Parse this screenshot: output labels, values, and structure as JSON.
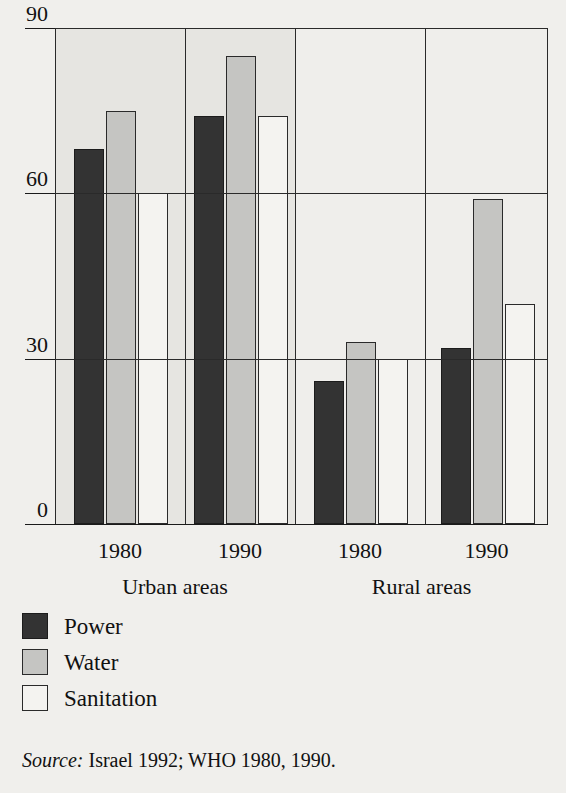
{
  "chart_data": {
    "type": "bar",
    "title": "",
    "xlabel": "",
    "ylabel": "",
    "ylim": [
      0,
      90
    ],
    "yticks": [
      0,
      30,
      60,
      90
    ],
    "ytick_labels": [
      "0",
      "30",
      "60",
      "90"
    ],
    "grid": true,
    "legend_position": "below-left",
    "categories": [
      "1980",
      "1990",
      "1980",
      "1990"
    ],
    "groups": [
      {
        "label": "Urban areas",
        "categories": [
          "1980",
          "1990"
        ]
      },
      {
        "label": "Rural areas",
        "categories": [
          "1980",
          "1990"
        ]
      }
    ],
    "series": [
      {
        "name": "Power",
        "color": "#333333",
        "values": [
          68,
          74,
          26,
          32
        ]
      },
      {
        "name": "Water",
        "color": "#c5c5c2",
        "values": [
          75,
          85,
          33,
          59
        ]
      },
      {
        "name": "Sanitation",
        "color": "#f4f3f0",
        "values": [
          60,
          74,
          30,
          40
        ]
      }
    ],
    "panels": [
      {
        "group": "Urban areas",
        "category": "1980",
        "shaded": true,
        "bars": [
          {
            "series": "Power",
            "value": 68
          },
          {
            "series": "Water",
            "value": 75
          },
          {
            "series": "Sanitation",
            "value": 60
          }
        ]
      },
      {
        "group": "Urban areas",
        "category": "1990",
        "shaded": true,
        "bars": [
          {
            "series": "Power",
            "value": 74
          },
          {
            "series": "Water",
            "value": 85
          },
          {
            "series": "Sanitation",
            "value": 74
          }
        ]
      },
      {
        "group": "Rural areas",
        "category": "1980",
        "shaded": false,
        "bars": [
          {
            "series": "Power",
            "value": 26
          },
          {
            "series": "Water",
            "value": 33
          },
          {
            "series": "Sanitation",
            "value": 30
          }
        ]
      },
      {
        "group": "Rural areas",
        "category": "1990",
        "shaded": false,
        "bars": [
          {
            "series": "Power",
            "value": 32
          },
          {
            "series": "Water",
            "value": 59
          },
          {
            "series": "Sanitation",
            "value": 40
          }
        ]
      }
    ]
  },
  "axis": {
    "y_ticks": [
      "90",
      "60",
      "30",
      "0"
    ]
  },
  "xaxis": {
    "ticks": [
      "1980",
      "1990",
      "1980",
      "1990"
    ],
    "group_labels": [
      "Urban areas",
      "Rural areas"
    ]
  },
  "legend": {
    "items": [
      {
        "label": "Power",
        "swatch": "power"
      },
      {
        "label": "Water",
        "swatch": "water"
      },
      {
        "label": "Sanitation",
        "swatch": "sanitation"
      }
    ]
  },
  "source": {
    "prefix": "Source:",
    "text": "Israel 1992; WHO 1980, 1990."
  },
  "colors": {
    "power": "#333333",
    "water": "#c5c5c2",
    "sanitation": "#f4f3f0",
    "panel_shaded": "#e6e5e1",
    "panel_plain": "#efeeeb",
    "ink": "#1a1a1a",
    "page": "#f0efec"
  }
}
